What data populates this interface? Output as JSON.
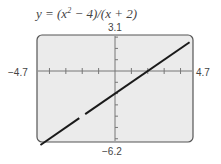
{
  "chart_data": {
    "type": "line",
    "title_parts": {
      "pre": "y = (x",
      "sup": "2",
      "post": " − 4)/(x + 2)"
    },
    "xlim": [
      -4.7,
      4.7
    ],
    "ylim": [
      -6.2,
      3.1
    ],
    "x_tick_spacing": 1,
    "y_tick_spacing": 1,
    "window_labels": {
      "xmin": "−4.7",
      "xmax": "4.7",
      "ymin": "−6.2",
      "ymax": "3.1"
    },
    "series": [
      {
        "name": "y = x - 2",
        "x": [
          -4.7,
          4.7
        ],
        "y": [
          -6.7,
          2.7
        ],
        "hole": {
          "x": -2,
          "y": -4
        }
      }
    ],
    "grid": false,
    "background": "#ebebeb",
    "line_color": "#1a1a1a"
  }
}
